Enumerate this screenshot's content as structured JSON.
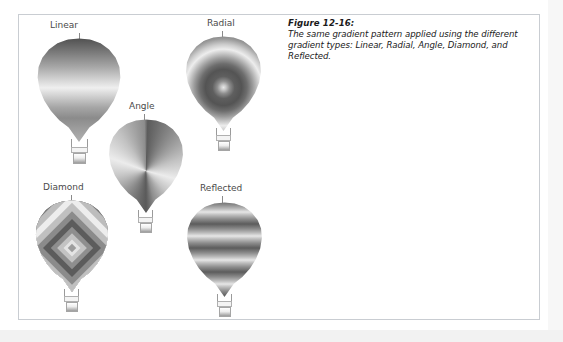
{
  "figure": {
    "number_label": "Figure 12-16:",
    "caption": "The same gradient pattern applied using the different gradient types: Linear, Radial, Angle, Diamond, and Reflected."
  },
  "colors": {
    "page_background": "#ffffff",
    "frame_border": "#c9cdd2",
    "label_text": "#4a4a4a",
    "caption_text": "#1a1a1a",
    "leader_line": "#8a8a8a",
    "gradient_dark": "#545454",
    "gradient_mid": "#9b9b9b",
    "gradient_light": "#ededed"
  },
  "balloons": [
    {
      "id": "linear",
      "label": "Linear",
      "gradient_type": "Linear",
      "description": "Vertical linear gradient, dark at top through light mid-band to darker base"
    },
    {
      "id": "radial",
      "label": "Radial",
      "gradient_type": "Radial",
      "description": "Concentric rings radiating from a light center point"
    },
    {
      "id": "angle",
      "label": "Angle",
      "gradient_type": "Angle",
      "description": "Conic sweep gradient rotating about the center"
    },
    {
      "id": "diamond",
      "label": "Diamond",
      "gradient_type": "Diamond",
      "description": "Nested diamond bands expanding from the center"
    },
    {
      "id": "reflected",
      "label": "Reflected",
      "gradient_type": "Reflected",
      "description": "Repeating mirrored horizontal bands"
    }
  ]
}
